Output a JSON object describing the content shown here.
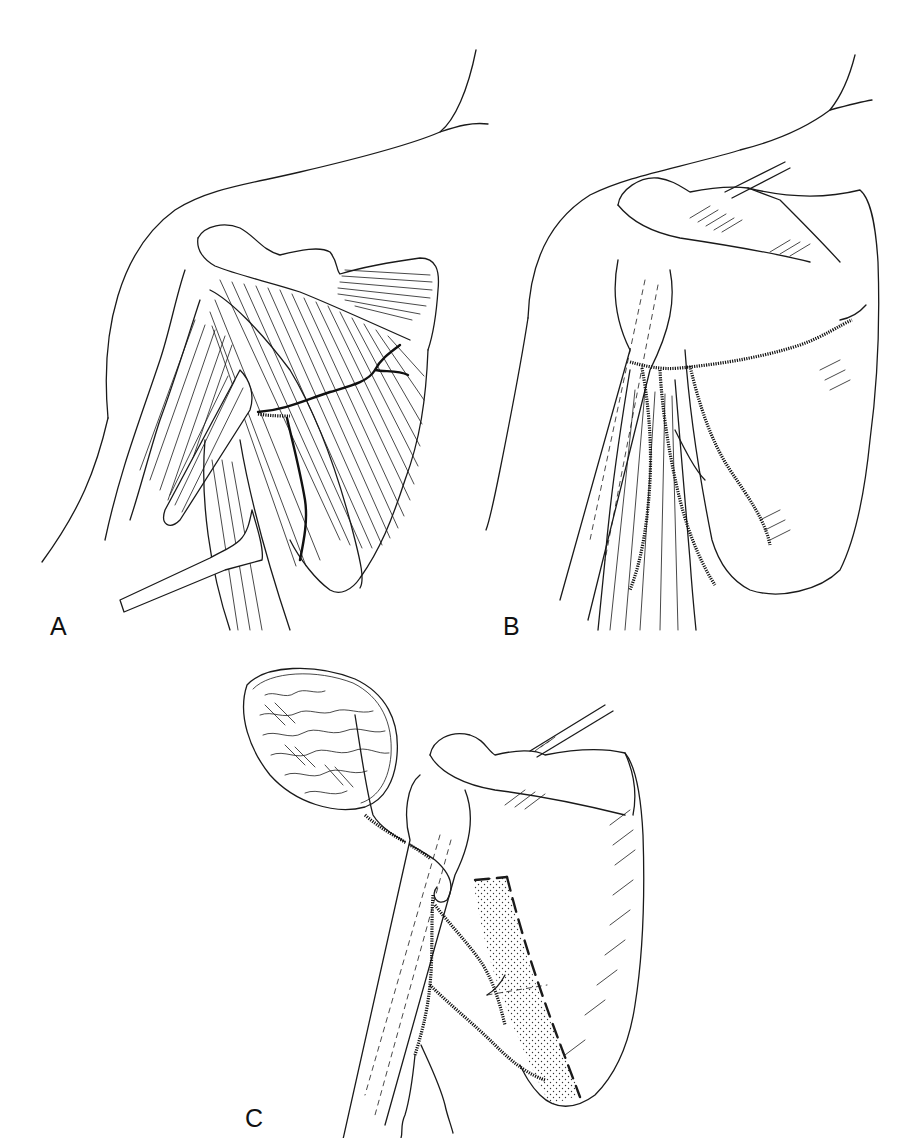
{
  "figure": {
    "background_color": "#ffffff",
    "ink_color": "#1a1a1a"
  },
  "panels": [
    {
      "id": "A",
      "label": "A",
      "subject": "posterior shoulder muscles with vessel coursing over muscle fibers; retractor lower left"
    },
    {
      "id": "B",
      "label": "B",
      "subject": "scapula with circumflex scapular vessel branches; humerus shown dashed"
    },
    {
      "id": "C",
      "label": "C",
      "subject": "scapular flap with vascular pedicle; stippled bone segment outlined by bold dashed line; tissue paddle upper left"
    }
  ]
}
